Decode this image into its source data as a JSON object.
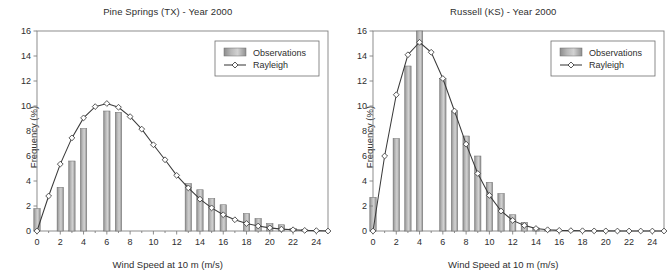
{
  "figure": {
    "panel_count": 2,
    "background": "#ffffff",
    "bar_color": "#9a9a9a",
    "bar_edge_color": "#6e6e6e",
    "line_color": "#3a3a3a",
    "axis_color": "#808080",
    "text_color": "#2e2e2e"
  },
  "chart_data": [
    {
      "type": "bar",
      "title": "Pine Springs (TX) - Year 2000",
      "xlabel": "Wind Speed at 10 m (m/s)",
      "ylabel": "Frequency (%)",
      "xlim": [
        0,
        25
      ],
      "ylim": [
        0,
        16
      ],
      "xticks": [
        0,
        2,
        4,
        6,
        8,
        10,
        12,
        14,
        16,
        18,
        20,
        22,
        24
      ],
      "yticks": [
        0,
        2,
        4,
        6,
        8,
        10,
        12,
        14,
        16
      ],
      "xticklabels": [
        "0",
        "2",
        "4",
        "6",
        "8",
        "10",
        "12",
        "14",
        "16",
        "18",
        "20",
        "22",
        "24"
      ],
      "yticklabels": [
        "0",
        "2",
        "4",
        "6",
        "8",
        "10",
        "12",
        "14",
        "16"
      ],
      "grid": false,
      "legend_position": "upper right",
      "categories": [
        0,
        1,
        2,
        3,
        4,
        5,
        6,
        7,
        8,
        9,
        10,
        11,
        12,
        13,
        14,
        15,
        16,
        17,
        18,
        19,
        20,
        21,
        22,
        23,
        24,
        25
      ],
      "series": [
        {
          "name": "Observations",
          "kind": "bar",
          "values": [
            1.8,
            0.0,
            3.5,
            5.6,
            8.2,
            0.0,
            9.6,
            9.5,
            0.0,
            0.0,
            0.0,
            0.0,
            0.0,
            3.8,
            3.3,
            2.6,
            2.1,
            0.0,
            1.4,
            1.0,
            0.6,
            0.5,
            0.2,
            0.1,
            0.05,
            0.0
          ]
        },
        {
          "name": "Rayleigh",
          "kind": "line",
          "marker": "diamond",
          "values": [
            0.0,
            2.8,
            5.35,
            7.45,
            9.05,
            9.95,
            10.2,
            9.9,
            9.15,
            8.15,
            6.9,
            5.7,
            4.45,
            3.45,
            2.55,
            1.85,
            1.3,
            0.9,
            0.6,
            0.4,
            0.25,
            0.15,
            0.1,
            0.05,
            0.03,
            0.0
          ]
        }
      ],
      "legend": [
        "Observations",
        "Rayleigh"
      ]
    },
    {
      "type": "bar",
      "title": "Russell (KS) - Year 2000",
      "xlabel": "Wind Speed at 10 m (m/s)",
      "ylabel": "Frequency (%)",
      "xlim": [
        0,
        25
      ],
      "ylim": [
        0,
        16
      ],
      "xticks": [
        0,
        2,
        4,
        6,
        8,
        10,
        12,
        14,
        16,
        18,
        20,
        22,
        24
      ],
      "yticks": [
        0,
        2,
        4,
        6,
        8,
        10,
        12,
        14,
        16
      ],
      "xticklabels": [
        "0",
        "2",
        "4",
        "6",
        "8",
        "10",
        "12",
        "14",
        "16",
        "18",
        "20",
        "22",
        "24"
      ],
      "yticklabels": [
        "0",
        "2",
        "4",
        "6",
        "8",
        "10",
        "12",
        "14",
        "16"
      ],
      "grid": false,
      "legend_position": "upper right",
      "categories": [
        0,
        1,
        2,
        3,
        4,
        5,
        6,
        7,
        8,
        9,
        10,
        11,
        12,
        13,
        14,
        15,
        16,
        17,
        18,
        19,
        20,
        21,
        22,
        23,
        24,
        25
      ],
      "series": [
        {
          "name": "Observations",
          "kind": "bar",
          "values": [
            2.7,
            0.0,
            7.4,
            13.2,
            16.0,
            0.0,
            12.2,
            9.6,
            7.6,
            6.0,
            3.9,
            3.0,
            1.3,
            0.7,
            0.25,
            0.1,
            0.05,
            0.0,
            0.0,
            0.0,
            0.0,
            0.0,
            0.0,
            0.0,
            0.0,
            0.0
          ]
        },
        {
          "name": "Rayleigh",
          "kind": "line",
          "marker": "diamond",
          "values": [
            0.0,
            6.0,
            10.9,
            14.1,
            15.1,
            14.3,
            12.2,
            9.6,
            6.95,
            4.6,
            2.85,
            1.6,
            0.85,
            0.45,
            0.2,
            0.1,
            0.05,
            0.03,
            0.02,
            0.01,
            0.01,
            0.0,
            0.0,
            0.0,
            0.0,
            0.0
          ]
        }
      ],
      "legend": [
        "Observations",
        "Rayleigh"
      ]
    }
  ],
  "panels": [
    {
      "title": "Pine Springs (TX) - Year 2000",
      "xlabel": "Wind Speed at 10 m (m/s)",
      "ylabel": "Frequency (%)",
      "legend": {
        "bar_label": "Observations",
        "line_label": "Rayleigh"
      }
    },
    {
      "title": "Russell (KS) - Year 2000",
      "xlabel": "Wind Speed at 10 m (m/s)",
      "ylabel": "Frequency (%)",
      "legend": {
        "bar_label": "Observations",
        "line_label": "Rayleigh"
      }
    }
  ]
}
